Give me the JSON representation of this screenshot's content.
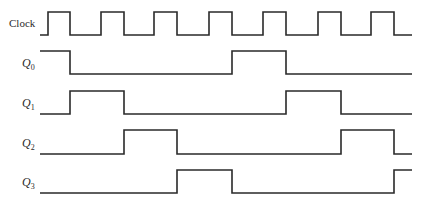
{
  "colors": {
    "line": "#2a2a2a",
    "background": "#ffffff"
  },
  "layout": {
    "x_start": 40,
    "x_end": 412
  },
  "signals": [
    {
      "id": "clock",
      "label": "Clock",
      "subscript": "",
      "high_y": 12,
      "low_y": 35,
      "label_y": 27,
      "start_level": 0,
      "transitions": [
        48,
        70,
        101,
        124,
        154,
        177,
        209,
        232,
        263,
        286,
        318,
        341,
        371,
        394
      ]
    },
    {
      "id": "q0",
      "label": "Q",
      "subscript": "0",
      "high_y": 51,
      "low_y": 74,
      "label_y": 67,
      "start_level": 1,
      "transitions": [
        70,
        232,
        286
      ]
    },
    {
      "id": "q1",
      "label": "Q",
      "subscript": "1",
      "high_y": 91,
      "low_y": 114,
      "label_y": 107,
      "start_level": 0,
      "transitions": [
        70,
        124,
        286,
        341
      ]
    },
    {
      "id": "q2",
      "label": "Q",
      "subscript": "2",
      "high_y": 130,
      "low_y": 154,
      "label_y": 147,
      "start_level": 0,
      "transitions": [
        124,
        177,
        341,
        394
      ]
    },
    {
      "id": "q3",
      "label": "Q",
      "subscript": "3",
      "high_y": 170,
      "low_y": 193,
      "label_y": 186,
      "start_level": 0,
      "transitions": [
        177,
        232,
        394
      ]
    }
  ]
}
